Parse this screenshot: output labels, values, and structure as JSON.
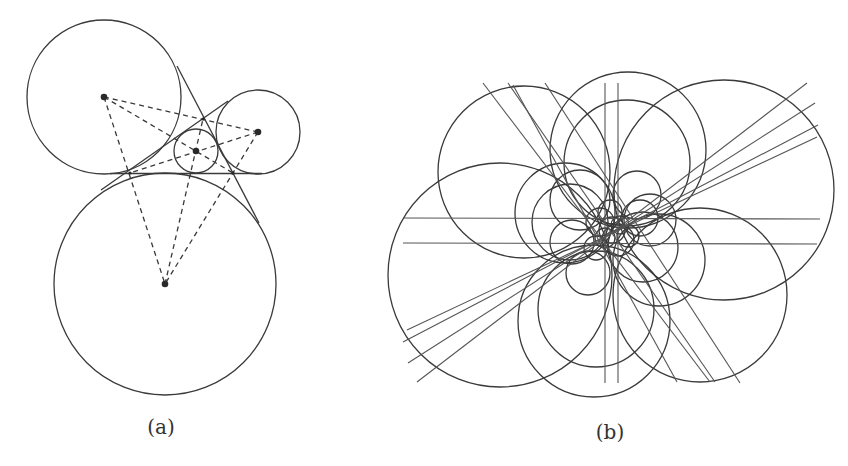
{
  "figure": {
    "panels": [
      {
        "id": "a",
        "label": "(a)",
        "description": "Three mutually tangent circles with common tangent lines forming a triangle; inscribed small circle; dashed lines joining centers"
      },
      {
        "id": "b",
        "label": "(b)",
        "description": "Flower-like arrangement of many circles and straight lines all passing near a common central region"
      }
    ],
    "colors": {
      "stroke": "#3a3a3a",
      "background": "#ffffff"
    }
  }
}
